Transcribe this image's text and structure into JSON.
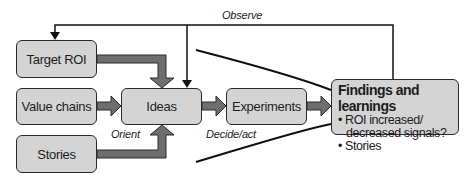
{
  "diagram": {
    "type": "OODA-style flow diagram",
    "colors": {
      "box_fill": "#d4d4d4",
      "box_border": "#2a2a2a",
      "arrow_fill": "#6e6e6e",
      "line": "#111111",
      "background": "#ffffff"
    },
    "nodes": {
      "target_roi": "Target ROI",
      "value_chains": "Value chains",
      "stories": "Stories",
      "ideas": "Ideas",
      "experiments": "Experiments",
      "findings": {
        "title": "Findings and learnings",
        "bullets": [
          {
            "line1": "• ROI increased/",
            "line2": "decreased signals?"
          },
          {
            "line1": "• Stories"
          }
        ]
      }
    },
    "labels": {
      "observe": "Observe",
      "orient": "Orient",
      "decide_act": "Decide/act"
    },
    "edges": [
      {
        "from": "target_roi",
        "to": "ideas",
        "style": "thick-arrow"
      },
      {
        "from": "value_chains",
        "to": "ideas",
        "style": "thick-arrow"
      },
      {
        "from": "stories",
        "to": "ideas",
        "style": "thick-arrow"
      },
      {
        "from": "ideas",
        "to": "experiments",
        "style": "thick-arrow"
      },
      {
        "from": "experiments",
        "to": "findings",
        "style": "thick-arrow"
      },
      {
        "from": "findings",
        "to": "target_roi",
        "style": "thin-arrow",
        "label": "Observe"
      },
      {
        "from": "findings",
        "to": "ideas",
        "style": "thin-arrow",
        "label": "Observe"
      }
    ]
  }
}
